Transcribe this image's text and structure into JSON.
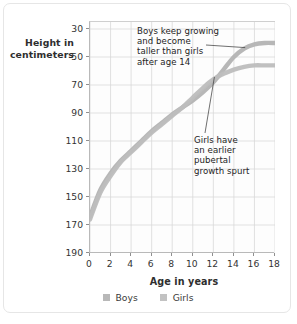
{
  "chart_data": {
    "type": "line",
    "title": "",
    "xlabel": "Age in years",
    "ylabel": "Height in centimeters",
    "xlim": [
      0,
      18
    ],
    "ylim": [
      30,
      195
    ],
    "xticks": [
      0,
      2,
      4,
      6,
      8,
      10,
      12,
      14,
      16,
      18
    ],
    "yticks": [
      30,
      50,
      70,
      90,
      110,
      130,
      150,
      170,
      190
    ],
    "grid": true,
    "legend_position": "bottom",
    "x": [
      0,
      1,
      2,
      3,
      4,
      5,
      6,
      7,
      8,
      9,
      10,
      11,
      12,
      13,
      14,
      15,
      16,
      17,
      18
    ],
    "series": [
      {
        "name": "Boys",
        "color": "#b3b3b3",
        "values": [
          56,
          75,
          87,
          96,
          103,
          110,
          117,
          123,
          129,
          134,
          139,
          145,
          152,
          161,
          170,
          176,
          179,
          180,
          180
        ]
      },
      {
        "name": "Girls",
        "color": "#bdbdbd",
        "values": [
          54,
          73,
          85,
          95,
          102,
          109,
          116,
          122,
          128,
          134,
          141,
          148,
          154,
          158,
          161,
          163,
          164,
          164,
          164
        ]
      }
    ],
    "annotations": [
      {
        "id": "boys-note",
        "text": "Boys keep growing and become taller than girls after age 14",
        "lines": [
          "Boys keep growing",
          "and become",
          "taller than girls",
          "after age 14"
        ],
        "points_to": {
          "x": 15.2,
          "y": 176
        }
      },
      {
        "id": "girls-note",
        "text": "Girls have an earlier pubertal growth spurt",
        "lines": [
          "Girls have",
          "an earlier",
          "pubertal",
          "growth spurt"
        ],
        "points_to": {
          "x": 12.2,
          "y": 155
        }
      }
    ]
  },
  "axes": {
    "y_title_lines": [
      "Height in",
      "centimeters"
    ],
    "x_title": "Age in years",
    "y_tick_labels": [
      "190",
      "170",
      "150",
      "130",
      "110",
      "90",
      "70",
      "50",
      "30"
    ],
    "x_tick_labels": [
      "0",
      "2",
      "4",
      "6",
      "8",
      "10",
      "12",
      "14",
      "16",
      "18"
    ]
  },
  "annotations": {
    "boys": {
      "line1": "Boys keep growing",
      "line2": "and become",
      "line3": "taller than girls",
      "line4": "after age 14"
    },
    "girls": {
      "line1": "Girls have",
      "line2": "an earlier",
      "line3": "pubertal",
      "line4": "growth spurt"
    }
  },
  "legend": {
    "items": [
      {
        "label": "Boys",
        "color": "#b8b8b8"
      },
      {
        "label": "Girls",
        "color": "#c2c2c2"
      }
    ]
  },
  "colors": {
    "boys_line": "#b3b3b3",
    "girls_line": "#bdbdbd",
    "grid": "#d9d9d9",
    "axis": "#b0b0b0",
    "frame": "#e6e6e6",
    "text": "#2e2e2e"
  }
}
